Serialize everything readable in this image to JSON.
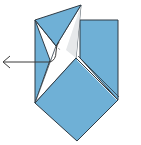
{
  "diagram": {
    "type": "origami-fold-step",
    "colors": {
      "paper_color": "#6fb0d6",
      "paper_white": "#ffffff",
      "paper_shade": "#e6e8ea",
      "edge": "#2f3b45",
      "arrow": "#3a3a3a",
      "background": "#ffffff"
    },
    "shapes": {
      "back_square": "80,20 118,20 118,100 80,58",
      "lower_diamond": "35,103 76,58 118,100 77,141",
      "left_strip": "35,20 45,32 35,103",
      "front_flap": "35,20 81,5 57,43 35,103",
      "white_inner": "81,5 76,58 35,103 57,43",
      "shaded_inner": "81,5 76,58 66,44"
    },
    "arrow": {
      "label": "fold direction arrow",
      "direction": "left",
      "tip": [
        3,
        62
      ],
      "tail": [
        50,
        62
      ]
    }
  }
}
